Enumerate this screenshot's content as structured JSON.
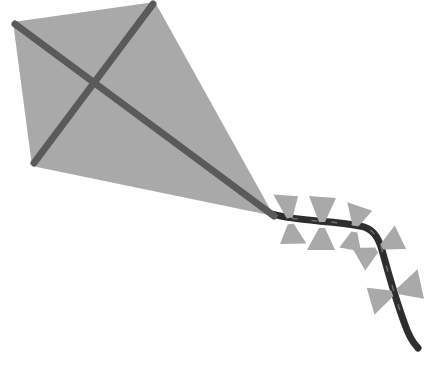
{
  "image": {
    "subject": "kite",
    "background": "#ffffff",
    "kite_fill": "#a9a9a9",
    "spar_color": "#5a5a5a",
    "bow_fill": "#a9a9a9",
    "tail_color": "#2e2e2e",
    "bow_count": 5
  }
}
